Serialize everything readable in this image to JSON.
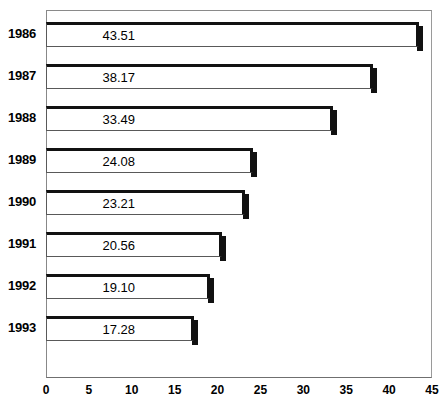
{
  "chart_data": {
    "type": "bar",
    "orientation": "horizontal",
    "title": "",
    "xlabel": "",
    "ylabel": "",
    "categories": [
      "1986",
      "1987",
      "1988",
      "1989",
      "1990",
      "1991",
      "1992",
      "1993"
    ],
    "values": [
      43.51,
      38.17,
      33.49,
      24.08,
      23.21,
      20.56,
      19.1,
      17.28
    ],
    "value_labels": [
      "43.51",
      "38.17",
      "33.49",
      "24.08",
      "23.21",
      "20.56",
      "19.10",
      "17.28"
    ],
    "xlim": [
      0,
      45
    ],
    "xticks": [
      0,
      5,
      10,
      15,
      20,
      25,
      30,
      35,
      40,
      45
    ],
    "xtick_labels": [
      "0",
      "5",
      "10",
      "15",
      "20",
      "25",
      "30",
      "35",
      "40",
      "45"
    ],
    "grid": false,
    "legend": null,
    "colors": {
      "bar_fill": "#ffffff",
      "bar_edge": "#111111",
      "axis": "#6f6f6f",
      "frame": "#8a8a8a",
      "text": "#000000"
    }
  }
}
